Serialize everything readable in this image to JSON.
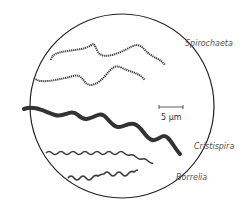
{
  "diagram": {
    "labels": {
      "spirochaeta": "Spirochaeta",
      "cristispira": "Cristispira",
      "borrelia": "Borrelia"
    },
    "scale_bar": {
      "label": "5 μm"
    },
    "colors": {
      "outline": "#222222",
      "organism": "#3a3a3a",
      "label": "#555555"
    }
  }
}
